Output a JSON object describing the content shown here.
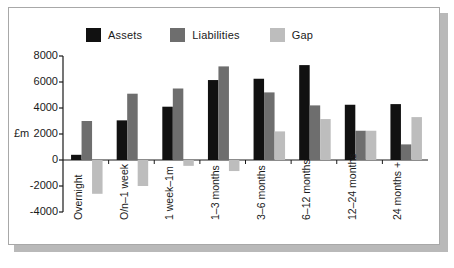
{
  "chart_data": {
    "type": "bar",
    "title": "",
    "subtitle": "",
    "xlabel": "",
    "ylabel": "£m",
    "ylim": [
      -4000,
      8000
    ],
    "ytick_labels": [
      "8000",
      "6000",
      "4000",
      "2000",
      "0",
      "-2000",
      "-4000"
    ],
    "ytick_values": [
      8000,
      6000,
      4000,
      2000,
      0,
      -2000,
      -4000
    ],
    "grid": false,
    "legend_position": "top",
    "categories": [
      "Overnight",
      "O/n–1 week",
      "1 week–1m",
      "1–3 months",
      "3–6 months",
      "6–12 months",
      "12–24 months",
      "24 months +"
    ],
    "series": [
      {
        "name": "Assets",
        "color": "#111111",
        "values": [
          400,
          3050,
          4100,
          6150,
          6250,
          7300,
          4250,
          4300
        ]
      },
      {
        "name": "Liabilities",
        "color": "#6e6e6e",
        "values": [
          3000,
          5100,
          5500,
          7200,
          5200,
          4200,
          2250,
          1200
        ]
      },
      {
        "name": "Gap",
        "color": "#bdbdbd",
        "values": [
          -2600,
          -2000,
          -450,
          -850,
          2200,
          3150,
          2250,
          3300
        ]
      }
    ]
  },
  "legend": {
    "items": [
      {
        "label": "Assets",
        "color": "#111111"
      },
      {
        "label": "Liabilities",
        "color": "#6e6e6e"
      },
      {
        "label": "Gap",
        "color": "#bdbdbd"
      }
    ]
  },
  "axis": {
    "y_title": "£m"
  }
}
